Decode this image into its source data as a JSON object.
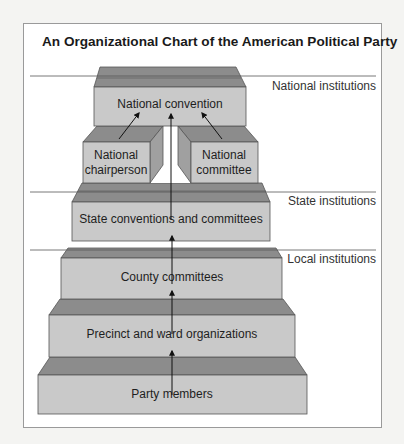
{
  "title": "An Organizational Chart of the American Political Party",
  "levels": [
    {
      "label": "National institutions"
    },
    {
      "label": "State institutions"
    },
    {
      "label": "Local institutions"
    }
  ],
  "nodes": {
    "national_convention": "National convention",
    "national_chairperson_1": "National",
    "national_chairperson_2": "chairperson",
    "national_committee_1": "National",
    "national_committee_2": "committee",
    "state": "State conventions and committees",
    "county": "County committees",
    "precinct": "Precinct and ward organizations",
    "party": "Party members"
  },
  "colors": {
    "front": "#c9c9c9",
    "top": "#8c8c8c",
    "side": "#a0a0a0",
    "stroke": "#555555",
    "line": "#555555"
  }
}
